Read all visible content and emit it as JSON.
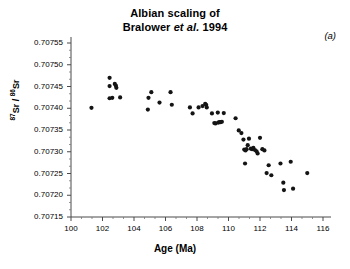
{
  "figure": {
    "title_line1": "Albian scaling of",
    "title_line2_pre": "Bralower ",
    "title_line2_italic": "et al.",
    "title_line2_post": " 1994",
    "panel_label": "(a)"
  },
  "chart_data": {
    "type": "scatter",
    "title": "Albian scaling of Bralower et al. 1994",
    "xlabel": "Age  (Ma)",
    "ylabel": "87Sr / 86Sr",
    "ylabel_num": "87",
    "ylabel_mid": "Sr / ",
    "ylabel_den": "86",
    "ylabel_end": "Sr",
    "xlim": [
      100,
      116.6
    ],
    "ylim": [
      0.70715,
      0.70755
    ],
    "xticks": [
      100,
      102,
      104,
      106,
      108,
      110,
      112,
      114,
      116
    ],
    "xtick_labels": [
      "100",
      "102",
      "104",
      "106",
      "108",
      "110",
      "112",
      "114",
      "116"
    ],
    "yticks": [
      0.70715,
      0.7072,
      0.70725,
      0.7073,
      0.70735,
      0.7074,
      0.70745,
      0.7075,
      0.70755
    ],
    "ytick_labels": [
      "0.70715",
      "0.70720",
      "0.70725",
      "0.70730",
      "0.70735",
      "0.70740",
      "0.70745",
      "0.70750",
      "0.70755"
    ],
    "x_minor_count": 2,
    "y_minor_count": 2,
    "grid": false,
    "legend": "none",
    "marker": "filled-circle",
    "marker_color": "#141414",
    "marker_size_px": 4.2,
    "points": [
      [
        101.3,
        0.707401
      ],
      [
        102.45,
        0.70747
      ],
      [
        102.45,
        0.707451
      ],
      [
        102.78,
        0.707456
      ],
      [
        102.85,
        0.707452
      ],
      [
        102.88,
        0.707447
      ],
      [
        102.45,
        0.707423
      ],
      [
        102.62,
        0.707424
      ],
      [
        103.12,
        0.707425
      ],
      [
        104.88,
        0.707397
      ],
      [
        104.92,
        0.707424
      ],
      [
        105.1,
        0.707437
      ],
      [
        105.62,
        0.707413
      ],
      [
        106.32,
        0.707437
      ],
      [
        106.4,
        0.707408
      ],
      [
        107.55,
        0.707402
      ],
      [
        107.72,
        0.707388
      ],
      [
        108.1,
        0.707402
      ],
      [
        108.35,
        0.707405
      ],
      [
        108.52,
        0.70741
      ],
      [
        108.58,
        0.707408
      ],
      [
        108.62,
        0.707402
      ],
      [
        108.95,
        0.707388
      ],
      [
        109.1,
        0.707366
      ],
      [
        109.18,
        0.707365
      ],
      [
        109.35,
        0.707367
      ],
      [
        109.42,
        0.707368
      ],
      [
        109.5,
        0.707368
      ],
      [
        109.58,
        0.707369
      ],
      [
        109.32,
        0.70739
      ],
      [
        109.7,
        0.707389
      ],
      [
        110.45,
        0.707377
      ],
      [
        110.65,
        0.707349
      ],
      [
        110.82,
        0.707343
      ],
      [
        110.95,
        0.707328
      ],
      [
        111.0,
        0.707305
      ],
      [
        111.08,
        0.707303
      ],
      [
        111.15,
        0.707306
      ],
      [
        111.22,
        0.707315
      ],
      [
        111.3,
        0.70733
      ],
      [
        111.42,
        0.707307
      ],
      [
        111.5,
        0.707306
      ],
      [
        111.58,
        0.707309
      ],
      [
        111.68,
        0.707304
      ],
      [
        111.78,
        0.707301
      ],
      [
        111.85,
        0.707296
      ],
      [
        112.0,
        0.707332
      ],
      [
        112.15,
        0.707306
      ],
      [
        112.28,
        0.707303
      ],
      [
        111.05,
        0.707273
      ],
      [
        112.42,
        0.707251
      ],
      [
        112.55,
        0.707269
      ],
      [
        112.72,
        0.707246
      ],
      [
        113.48,
        0.707229
      ],
      [
        113.52,
        0.707212
      ],
      [
        114.1,
        0.707215
      ],
      [
        113.3,
        0.707273
      ],
      [
        113.95,
        0.707277
      ],
      [
        115.0,
        0.707251
      ]
    ]
  }
}
